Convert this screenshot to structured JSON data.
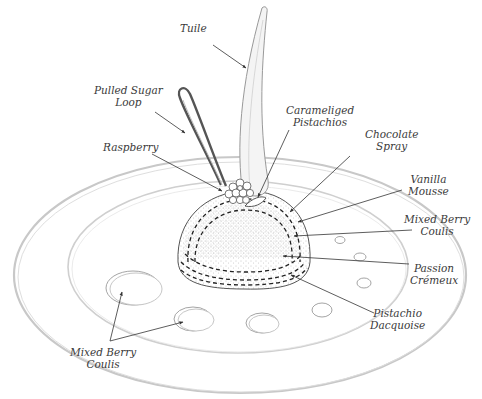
{
  "diagram": {
    "colors": {
      "ink": "#3a3a3a",
      "pencil": "#bdbdbd",
      "dots": "#777777",
      "background": "#ffffff"
    },
    "labels": [
      {
        "id": "tuile",
        "lines": [
          "Tuile"
        ]
      },
      {
        "id": "pulled-sugar-loop",
        "lines": [
          "Pulled Sugar",
          "Loop"
        ]
      },
      {
        "id": "raspberry",
        "lines": [
          "Raspberry"
        ]
      },
      {
        "id": "caramelized-pistachios",
        "lines": [
          "Carameliged",
          "Pistachios"
        ]
      },
      {
        "id": "chocolate-spray",
        "lines": [
          "Chocolate",
          "Spray"
        ]
      },
      {
        "id": "vanilla-mousse",
        "lines": [
          "Vanilla",
          "Mousse"
        ]
      },
      {
        "id": "mixed-berry-coulis-right",
        "lines": [
          "Mixed Berry",
          "Coulis"
        ]
      },
      {
        "id": "passion-cremeux",
        "lines": [
          "Passion",
          "Crémeux"
        ]
      },
      {
        "id": "pistachio-dacquoise",
        "lines": [
          "Pistachio",
          "Dacquoise"
        ]
      },
      {
        "id": "mixed-berry-coulis-left",
        "lines": [
          "Mixed Berry",
          "Coulis"
        ]
      }
    ]
  }
}
